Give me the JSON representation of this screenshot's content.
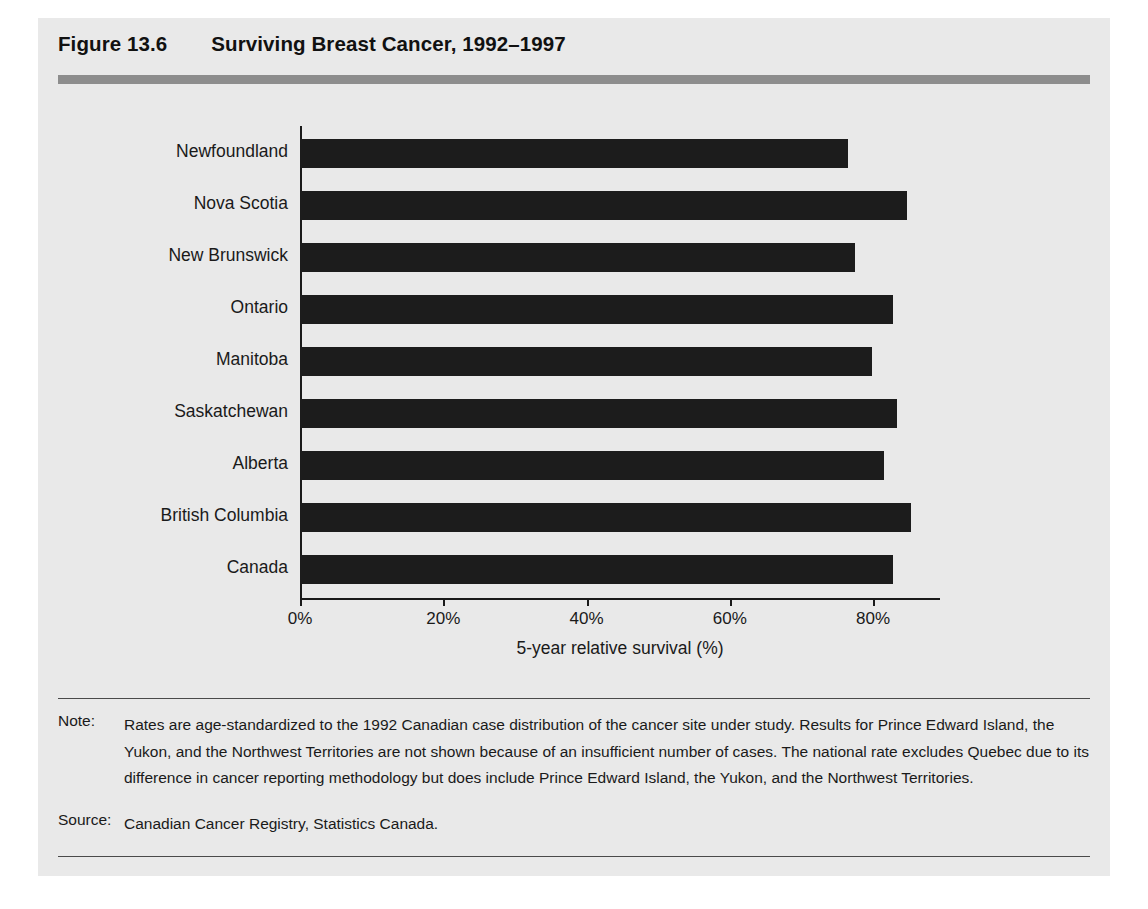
{
  "figure": {
    "number": "Figure 13.6",
    "title": "Surviving Breast Cancer, 1992–1997"
  },
  "chart_data": {
    "type": "bar",
    "orientation": "horizontal",
    "title": "Surviving Breast Cancer, 1992–1997",
    "categories": [
      "Newfoundland",
      "Nova Scotia",
      "New Brunswick",
      "Ontario",
      "Manitoba",
      "Saskatchewan",
      "Alberta",
      "British Columbia",
      "Canada"
    ],
    "values": [
      76.5,
      84.8,
      77.5,
      82.8,
      79.9,
      83.4,
      81.6,
      85.3,
      82.8
    ],
    "xlabel": "5-year relative survival (%)",
    "ylabel": "",
    "xlim": [
      0,
      100
    ],
    "xticks": [
      0,
      20,
      40,
      60,
      80
    ],
    "xticklabels": [
      "0%",
      "20%",
      "40%",
      "60%",
      "80%"
    ],
    "grid": false,
    "legend": false,
    "bar_color": "#1c1c1c"
  },
  "notes": {
    "note_label": "Note:",
    "note_text": "Rates are age-standardized to the 1992 Canadian case distribution of the cancer site under study. Results for Prince Edward Island, the Yukon, and the Northwest Territories are not shown because of an insufficient number of cases. The national rate excludes Quebec due to its difference in cancer reporting methodology but does include Prince Edward Island, the Yukon, and the Northwest Territories.",
    "source_label": "Source:",
    "source_text": "Canadian Cancer Registry, Statistics Canada."
  },
  "colors": {
    "panel_background": "#e9e9e9",
    "title_rule": "#8d8d8d",
    "bar": "#1c1c1c",
    "axis": "#1a1a1a",
    "text": "#1a1a1a"
  }
}
